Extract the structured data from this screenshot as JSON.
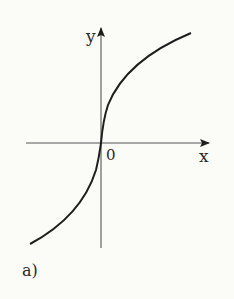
{
  "figure": {
    "panel_label": "a)",
    "x_axis_label": "x",
    "y_axis_label": "y",
    "origin_label": "0",
    "colors": {
      "background": "#fbfcf7",
      "ink": "#1e1e1e",
      "axis": "#555555"
    },
    "curve": {
      "description": "odd increasing function, vertical tangent at origin (cube-root like)",
      "passes_through_origin": true
    }
  }
}
